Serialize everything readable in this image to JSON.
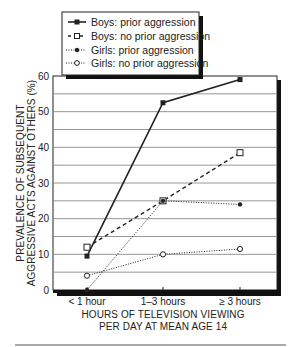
{
  "chart_data": {
    "type": "line",
    "title": "",
    "categories": [
      "< 1 hour",
      "1–3 hours",
      "≥ 3 hours"
    ],
    "xlabel": "HOURS OF TELEVISION VIEWING PER DAY AT MEAN AGE 14",
    "xlabel_lines": [
      "HOURS OF TELEVISION VIEWING",
      "PER DAY AT MEAN AGE 14"
    ],
    "ylabel": "PREVALENCE OF SUBSEQUENT AGGRESSIVE ACTS AGAINST OTHERS (%)",
    "ylabel_lines": [
      "PREVALENCE OF SUBSEQUENT",
      "AGGRESSIVE ACTS AGAINST OTHERS (%)"
    ],
    "ylim": [
      0,
      60
    ],
    "yticks": [
      0,
      10,
      20,
      30,
      40,
      50,
      60
    ],
    "grid": true,
    "grid_step": 5,
    "legend_position": "top-left",
    "series": [
      {
        "name": "Boys: prior aggression",
        "values": [
          9.5,
          52.5,
          59
        ],
        "line": "solid",
        "marker": "filled-square"
      },
      {
        "name": "Boys: no prior aggression",
        "values": [
          12,
          25,
          38.5
        ],
        "line": "dashed",
        "marker": "open-square"
      },
      {
        "name": "Girls: prior aggression",
        "values": [
          0,
          25,
          24
        ],
        "line": "dotted",
        "marker": "filled-circle"
      },
      {
        "name": "Girls: no prior aggression",
        "values": [
          4,
          10,
          11.5
        ],
        "line": "dotted",
        "marker": "open-circle"
      }
    ]
  },
  "legend": {
    "items": [
      {
        "label": "Boys: prior aggression"
      },
      {
        "label": "Boys: no prior aggression"
      },
      {
        "label": "Girls: prior aggression"
      },
      {
        "label": "Girls: no prior aggression"
      }
    ]
  },
  "colors": {
    "ink": "#222222",
    "grid": "#888888",
    "shadow": "#111111"
  }
}
